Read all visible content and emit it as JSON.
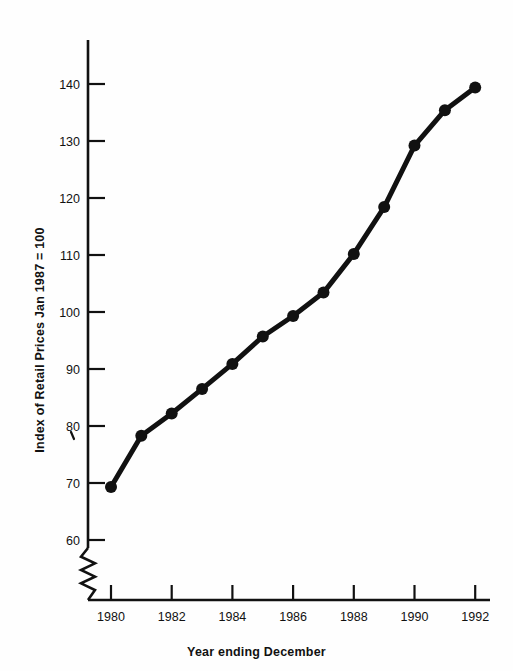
{
  "chart_data": {
    "type": "line",
    "title": "",
    "xlabel": "Year ending December",
    "ylabel": "Index of Retail Prices Jan 1987 = 100",
    "x": [
      1980,
      1981,
      1982,
      1983,
      1984,
      1985,
      1986,
      1987,
      1988,
      1989,
      1990,
      1991,
      1992
    ],
    "values": [
      69.3,
      78.3,
      82.2,
      86.5,
      90.9,
      95.7,
      99.3,
      103.4,
      110.2,
      118.4,
      129.2,
      135.4,
      139.4
    ],
    "series": [
      {
        "name": "Index of Retail Prices",
        "values": [
          69.3,
          78.3,
          82.2,
          86.5,
          90.9,
          95.7,
          99.3,
          103.4,
          110.2,
          118.4,
          129.2,
          135.4,
          139.4
        ]
      }
    ],
    "xlim": [
      1979.2,
      1992.6
    ],
    "ylim": [
      56.0,
      146.0
    ],
    "ytick_labels": [
      "60",
      "70",
      "80",
      "90",
      "100",
      "110",
      "120",
      "130",
      "140"
    ],
    "ytick_values": [
      60,
      70,
      80,
      90,
      100,
      110,
      120,
      130,
      140
    ],
    "xtick_labels": [
      "1980",
      "1982",
      "1984",
      "1986",
      "1988",
      "1990",
      "1992"
    ],
    "xtick_values": [
      1980,
      1982,
      1984,
      1986,
      1988,
      1990,
      1992
    ],
    "grid": false,
    "legend": false,
    "legend_position": "none",
    "axis_break": {
      "axis": "y",
      "style": "zigzag",
      "below_value": 60
    },
    "marker": "filled-circle",
    "line_style": "solid-thick",
    "color": "#111111"
  },
  "figure": {
    "background": "#fefefe",
    "ink_color": "#111111"
  }
}
